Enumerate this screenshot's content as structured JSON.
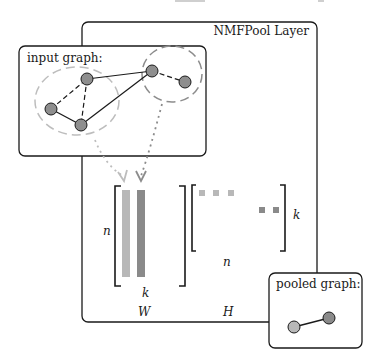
{
  "header_fragment": "...approach ... figure ... g",
  "layer": {
    "title": "NMFPool Layer"
  },
  "input_graph": {
    "title": "input graph:",
    "nodes": [
      {
        "id": "a",
        "x": 51,
        "y": 109,
        "cluster": 1
      },
      {
        "id": "b",
        "x": 87,
        "y": 79,
        "cluster": 1
      },
      {
        "id": "c",
        "x": 81,
        "y": 125,
        "cluster": 1
      },
      {
        "id": "d",
        "x": 152,
        "y": 71,
        "cluster": 2
      },
      {
        "id": "e",
        "x": 185,
        "y": 82,
        "cluster": 2
      }
    ],
    "edges": [
      {
        "from": "a",
        "to": "b",
        "style": "dashed"
      },
      {
        "from": "b",
        "to": "c",
        "style": "dashed"
      },
      {
        "from": "a",
        "to": "c",
        "style": "solid"
      },
      {
        "from": "b",
        "to": "d",
        "style": "solid"
      },
      {
        "from": "c",
        "to": "d",
        "style": "solid"
      },
      {
        "from": "d",
        "to": "e",
        "style": "dashed"
      }
    ],
    "clusters": [
      {
        "id": 1,
        "color": "#bdbdbd"
      },
      {
        "id": 2,
        "color": "#8c8c8c"
      }
    ]
  },
  "matrices": {
    "W": {
      "name": "W",
      "rows_label": "n",
      "cols_label": "k"
    },
    "H": {
      "name": "H",
      "rows_label": "k",
      "cols_label": "n"
    }
  },
  "pooled_graph": {
    "title": "pooled graph:"
  },
  "colors": {
    "cluster_light": "#b8b8b8",
    "cluster_dark": "#8a8a8a",
    "node_fill": "#8e8e8e",
    "border": "#1a1a1a"
  }
}
